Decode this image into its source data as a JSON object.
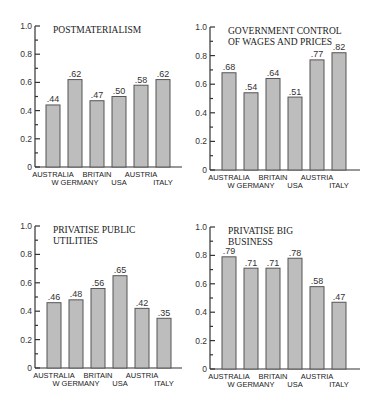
{
  "header": {
    "cut_text": ""
  },
  "chart_data": [
    {
      "type": "bar",
      "title": "POSTMATERIALISM",
      "title_lines": [
        "POSTMATERIALISM"
      ],
      "categories": [
        "AUSTRALIA",
        "W GERMANY",
        "BRITAIN",
        "USA",
        "AUSTRIA",
        "ITALY"
      ],
      "values": [
        0.44,
        0.62,
        0.47,
        0.5,
        0.58,
        0.62
      ],
      "value_labels": [
        ".44",
        ".62",
        ".47",
        ".50",
        ".58",
        ".62"
      ],
      "xlabel": "",
      "ylabel": "",
      "ylim": [
        0,
        1.0
      ],
      "yticks": [
        "0",
        "0.2",
        "0.4",
        "0.6",
        "0.8",
        "1.0"
      ],
      "grid": false
    },
    {
      "type": "bar",
      "title": "GOVERNMENT CONTROL OF WAGES AND PRICES",
      "title_lines": [
        "GOVERNMENT CONTROL",
        "OF WAGES AND PRICES"
      ],
      "categories": [
        "AUSTRALIA",
        "W GERMANY",
        "BRITAIN",
        "USA",
        "AUSTRIA",
        "ITALY"
      ],
      "values": [
        0.68,
        0.54,
        0.64,
        0.51,
        0.77,
        0.82
      ],
      "value_labels": [
        ".68",
        ".54",
        ".64",
        ".51",
        ".77",
        ".82"
      ],
      "xlabel": "",
      "ylabel": "",
      "ylim": [
        0,
        1.0
      ],
      "yticks": [
        "0",
        "0.2",
        "0.4",
        "0.6",
        "0.8",
        "1.0"
      ],
      "grid": false
    },
    {
      "type": "bar",
      "title": "PRIVATISE PUBLIC UTILITIES",
      "title_lines": [
        "PRIVATISE PUBLIC",
        "UTILITIES"
      ],
      "categories": [
        "AUSTRALIA",
        "W GERMANY",
        "BRITAIN",
        "USA",
        "AUSTRIA",
        "ITALY"
      ],
      "values": [
        0.46,
        0.48,
        0.56,
        0.65,
        0.42,
        0.35
      ],
      "value_labels": [
        ".46",
        ".48",
        ".56",
        ".65",
        ".42",
        ".35"
      ],
      "xlabel": "",
      "ylabel": "",
      "ylim": [
        0,
        1.0
      ],
      "yticks": [
        "0",
        "0.2",
        "0.4",
        "0.6",
        "0.8",
        "1.0"
      ],
      "grid": false
    },
    {
      "type": "bar",
      "title": "PRIVATISE BIG BUSINESS",
      "title_lines": [
        "PRIVATISE BIG",
        "BUSINESS"
      ],
      "categories": [
        "AUSTRALIA",
        "W GERMANY",
        "BRITAIN",
        "USA",
        "AUSTRIA",
        "ITALY"
      ],
      "values": [
        0.79,
        0.71,
        0.71,
        0.78,
        0.58,
        0.47
      ],
      "value_labels": [
        ".79",
        ".71",
        ".71",
        ".78",
        ".58",
        ".47"
      ],
      "xlabel": "",
      "ylabel": "",
      "ylim": [
        0,
        1.0
      ],
      "yticks": [
        "0",
        "0.2",
        "0.4",
        "0.6",
        "0.8",
        "1.0"
      ],
      "grid": false
    }
  ],
  "colors": {
    "bar_fill": "#bdbdbd",
    "bar_stroke": "#555555",
    "axis": "#333333",
    "text": "#222222"
  }
}
